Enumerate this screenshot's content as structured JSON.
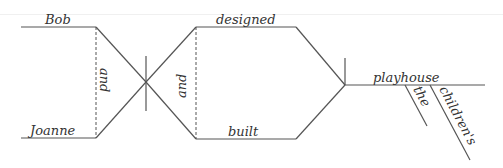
{
  "diagram": {
    "type": "sentence-diagram",
    "sentence": "Bob and Joanne designed and built the children's playhouse.",
    "subjects": [
      {
        "word": "Bob"
      },
      {
        "word": "Joanne"
      }
    ],
    "subject_conjunction": "and",
    "verbs": [
      {
        "word": "designed"
      },
      {
        "word": "built"
      }
    ],
    "verb_conjunction": "and",
    "direct_object": "playhouse",
    "modifiers": [
      {
        "word": "the",
        "modifies": "playhouse"
      },
      {
        "word": "children's",
        "modifies": "playhouse"
      }
    ],
    "colors": {
      "line": "#555555",
      "text": "#333333",
      "background": "#ffffff"
    }
  }
}
